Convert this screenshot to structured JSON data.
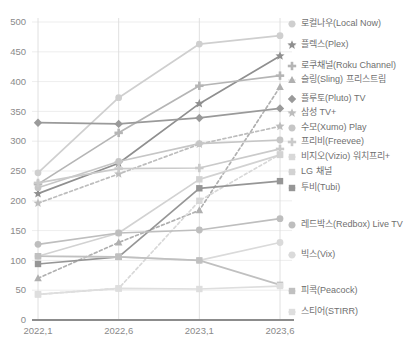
{
  "chart_data": {
    "type": "line",
    "title": "",
    "xlabel": "",
    "ylabel": "",
    "grid": true,
    "legend_position": "right",
    "ylim": [
      0,
      500
    ],
    "ytick_labels": [
      "0",
      "50",
      "100",
      "150",
      "200",
      "250",
      "300",
      "350",
      "400",
      "450",
      "500"
    ],
    "yticks": [
      0,
      50,
      100,
      150,
      200,
      250,
      300,
      350,
      400,
      450,
      500
    ],
    "categories": [
      "2022,1",
      "2022,6",
      "2023,1",
      "2023,6"
    ],
    "x": [
      "2022,1",
      "2022,6",
      "2023,1",
      "2023,6"
    ],
    "series": [
      {
        "name": "로컬나우(Local Now)",
        "values": [
          247,
          373,
          463,
          477
        ],
        "color": "#cfcfcf",
        "marker": "circle",
        "dashed": false
      },
      {
        "name": "플렉스(Plex)",
        "values": [
          212,
          263,
          363,
          443
        ],
        "color": "#8f8f8f",
        "marker": "star",
        "dashed": false
      },
      {
        "name": "로쿠채널(Roku Channel)",
        "values": [
          228,
          314,
          393,
          410
        ],
        "color": "#b5b5b5",
        "marker": "plus",
        "dashed": false
      },
      {
        "name": "슬링(Sling) 프리스트림",
        "values": [
          70,
          130,
          184,
          391
        ],
        "color": "#b0b0b0",
        "marker": "triangle",
        "dashed": true
      },
      {
        "name": "플루토(Pluto) TV",
        "values": [
          331,
          329,
          339,
          355
        ],
        "color": "#9a9a9a",
        "marker": "diamond",
        "dashed": false
      },
      {
        "name": "삼성 TV+",
        "values": [
          196,
          245,
          295,
          325
        ],
        "color": "#bdbdbd",
        "marker": "star",
        "dashed": true
      },
      {
        "name": "수모(Xumo) Play",
        "values": [
          222,
          266,
          296,
          302
        ],
        "color": "#c6c6c6",
        "marker": "circle",
        "dashed": false
      },
      {
        "name": "프리비(Freevee)",
        "values": [
          230,
          254,
          255,
          287
        ],
        "color": "#cacaca",
        "marker": "plus",
        "dashed": false
      },
      {
        "name": "비지오(Vizio) 워치프리+",
        "values": [
          43,
          53,
          200,
          278
        ],
        "color": "#d8d8d8",
        "marker": "square",
        "dashed": true
      },
      {
        "name": "LG 채널",
        "values": [
          107,
          146,
          236,
          277
        ],
        "color": "#d2d2d2",
        "marker": "square",
        "dashed": false
      },
      {
        "name": "투비(Tubi)",
        "values": [
          94,
          106,
          221,
          233
        ],
        "color": "#969696",
        "marker": "square",
        "dashed": false
      },
      {
        "name": "레드박스(Redbox) Live TV",
        "values": [
          127,
          146,
          151,
          170
        ],
        "color": "#bebebe",
        "marker": "circle",
        "dashed": false
      },
      {
        "name": "빅스(Vix)",
        "values": [
          107,
          106,
          100,
          130
        ],
        "color": "#dadada",
        "marker": "circle",
        "dashed": false
      },
      {
        "name": "피콕(Peacock)",
        "values": [
          107,
          106,
          100,
          59
        ],
        "color": "#c0c0c0",
        "marker": "square",
        "dashed": false
      },
      {
        "name": "스티어(STIRR)",
        "values": [
          43,
          53,
          52,
          57
        ],
        "color": "#dedede",
        "marker": "square",
        "dashed": false
      }
    ],
    "legend_entries": [
      {
        "label": "로컬나우(Local Now)",
        "y": 24,
        "marker": "circle",
        "color": "#cfcfcf"
      },
      {
        "label": "플렉스(Plex)",
        "y": 45,
        "marker": "star",
        "color": "#8f8f8f"
      },
      {
        "label": "로쿠채널(Roku Channel)",
        "y": 66,
        "marker": "plus",
        "color": "#b5b5b5"
      },
      {
        "label": "슬링(Sling) 프리스트림",
        "y": 80,
        "marker": "triangle",
        "color": "#b0b0b0"
      },
      {
        "label": "플루토(Pluto) TV",
        "y": 99,
        "marker": "diamond",
        "color": "#9a9a9a"
      },
      {
        "label": "삼성 TV+",
        "y": 113,
        "marker": "star",
        "color": "#bdbdbd"
      },
      {
        "label": "수모(Xumo) Play",
        "y": 128,
        "marker": "circle",
        "color": "#c6c6c6"
      },
      {
        "label": "프리비(Freevee)",
        "y": 142,
        "marker": "plus",
        "color": "#cacaca"
      },
      {
        "label": "비지오(Vizio) 워치프리+",
        "y": 157,
        "marker": "square",
        "color": "#d8d8d8"
      },
      {
        "label": "LG 채널",
        "y": 172,
        "marker": "square",
        "color": "#d2d2d2"
      },
      {
        "label": "투비(Tubi)",
        "y": 188,
        "marker": "square",
        "color": "#969696"
      },
      {
        "label": "레드박스(Redbox) Live TV",
        "y": 225,
        "marker": "circle",
        "color": "#bebebe"
      },
      {
        "label": "빅스(Vix)",
        "y": 255,
        "marker": "circle",
        "color": "#dadada"
      },
      {
        "label": "피콕(Peacock)",
        "y": 291,
        "marker": "square",
        "color": "#c0c0c0"
      },
      {
        "label": "스티어(STIRR)",
        "y": 312,
        "marker": "square",
        "color": "#dedede"
      }
    ]
  }
}
